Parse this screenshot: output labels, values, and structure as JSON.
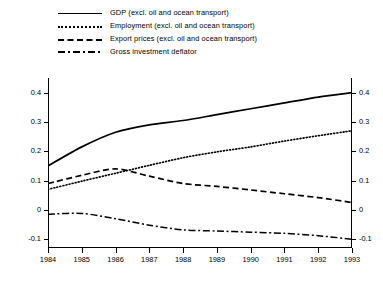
{
  "chart_data": {
    "type": "line",
    "title": "",
    "xlabel": "",
    "ylabel": "",
    "x": [
      1984,
      1985,
      1986,
      1987,
      1988,
      1989,
      1990,
      1991,
      1992,
      1993
    ],
    "xlim": [
      1984,
      1993
    ],
    "ylim": [
      -0.13,
      0.45
    ],
    "grid": false,
    "legend_position": "top",
    "dual_axis": true,
    "y_ticks": [
      -0.1,
      0,
      0.1,
      0.2,
      0.3,
      0.4
    ],
    "y_tick_labels": [
      "-0.1",
      "0",
      "0.1",
      "0.2",
      "0.3",
      "0.4"
    ],
    "y_tick_labels_right": [
      "-0.1",
      "0",
      "0.1",
      "0.2",
      "0.3",
      "0.4"
    ],
    "x_tick_labels": [
      "1984",
      "1985",
      "1986",
      "1987",
      "1988",
      "1989",
      "1990",
      "1991",
      "1992",
      "1993"
    ],
    "series": [
      {
        "name": "GDP (excl. oil and ocean transport)",
        "style": "solid",
        "values": [
          0.15,
          0.215,
          0.265,
          0.29,
          0.305,
          0.325,
          0.345,
          0.365,
          0.385,
          0.4
        ]
      },
      {
        "name": "Employment (excl. oil and ocean transport)",
        "style": "dotted",
        "values": [
          0.07,
          0.098,
          0.125,
          0.152,
          0.178,
          0.198,
          0.215,
          0.235,
          0.253,
          0.27
        ]
      },
      {
        "name": "Export prices (excl. oil and ocean transport)",
        "style": "dashed",
        "values": [
          0.09,
          0.118,
          0.14,
          0.115,
          0.09,
          0.08,
          0.068,
          0.055,
          0.042,
          0.025
        ]
      },
      {
        "name": "Gross investment deflator",
        "style": "dashdot",
        "values": [
          -0.015,
          -0.012,
          -0.03,
          -0.052,
          -0.068,
          -0.072,
          -0.076,
          -0.08,
          -0.088,
          -0.1
        ]
      }
    ]
  },
  "legend": {
    "items": [
      {
        "label": "GDP (excl. oil and ocean transport)",
        "style": "solid"
      },
      {
        "label": "Employment (excl. oil and ocean transport)",
        "style": "dotted"
      },
      {
        "label": "Export prices (excl. oil and ocean transport)",
        "style": "dashed"
      },
      {
        "label": "Gross investment deflator",
        "style": "dashdot"
      }
    ]
  },
  "colors": {
    "line": "#000000",
    "background": "#ffffff",
    "axis": "#000000"
  }
}
